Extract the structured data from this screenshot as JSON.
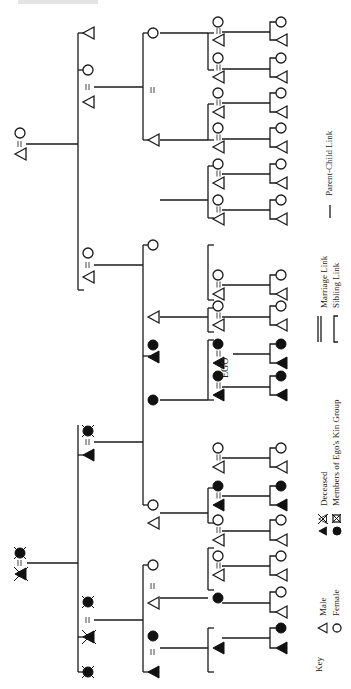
{
  "figure": {
    "title_fragment": "",
    "orientation": "rotated-90-ccw",
    "colors": {
      "ink": "#1a1a1a",
      "background": "#ffffff"
    }
  },
  "labels": {
    "ego": "EGO"
  },
  "legend": {
    "key_label": "Key",
    "male": "Male",
    "female": "Female",
    "deceased": "Deceased",
    "kin_group": "Members of Ego's Kin Group",
    "marriage_link": "Marriage Link",
    "sibling_link": "Sibling Link",
    "parent_child_link": "Parent-Child Link"
  },
  "symbols": [
    {
      "id": "g1-left-female",
      "gen": 1,
      "shape": "circle",
      "fill": "filled",
      "deceased": true,
      "x": 20,
      "y": 553
    },
    {
      "id": "g1-left-male",
      "gen": 1,
      "shape": "triangle",
      "fill": "filled",
      "deceased": true,
      "x": 20,
      "y": 575
    },
    {
      "id": "g1-right-male",
      "gen": 1,
      "shape": "triangle",
      "fill": "hollow",
      "deceased": false,
      "x": 20,
      "y": 155
    },
    {
      "id": "g1-right-female",
      "gen": 1,
      "shape": "circle",
      "fill": "hollow",
      "deceased": false,
      "x": 20,
      "y": 133
    },
    {
      "id": "g2-a-male",
      "gen": 2,
      "shape": "triangle",
      "fill": "filled",
      "deceased": true,
      "x": 88,
      "y": 638
    },
    {
      "id": "g2-b-male",
      "gen": 2,
      "shape": "triangle",
      "fill": "filled",
      "deceased": true,
      "x": 88,
      "y": 597
    },
    {
      "id": "g2-b-spouse",
      "gen": 2,
      "shape": "circle",
      "fill": "filled",
      "deceased": true,
      "x": 88,
      "y": 602
    },
    {
      "id": "g2-c-male",
      "gen": 2,
      "shape": "triangle",
      "fill": "filled",
      "deceased": false,
      "x": 88,
      "y": 455
    },
    {
      "id": "g2-c-spouse",
      "gen": 2,
      "shape": "circle",
      "fill": "filled",
      "deceased": true,
      "x": 88,
      "y": 432
    },
    {
      "id": "g2-d-female",
      "gen": 2,
      "shape": "circle",
      "fill": "hollow",
      "deceased": false,
      "x": 88,
      "y": 253
    },
    {
      "id": "g2-e-male",
      "gen": 2,
      "shape": "triangle",
      "fill": "hollow",
      "deceased": false,
      "x": 88,
      "y": 277
    },
    {
      "id": "g2-f-female",
      "gen": 2,
      "shape": "circle",
      "fill": "hollow",
      "deceased": false,
      "x": 88,
      "y": 69
    },
    {
      "id": "g2-g-male",
      "gen": 2,
      "shape": "triangle",
      "fill": "hollow",
      "deceased": false,
      "x": 88,
      "y": 35
    },
    {
      "id": "g2-g-spouse",
      "gen": 2,
      "shape": "circle",
      "fill": "hollow",
      "deceased": false,
      "x": 88,
      "y": 49
    }
  ],
  "ego": {
    "label": "EGO",
    "x": 222,
    "y": 367
  }
}
